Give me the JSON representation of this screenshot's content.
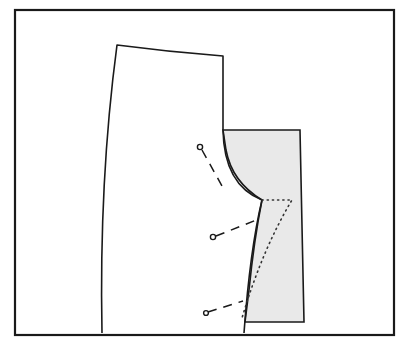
{
  "figure": {
    "colors": {
      "line": "#1a1a1a",
      "patch_fill": "#e9e9e9",
      "background": "#ffffff"
    },
    "elements": {
      "frame": "outer-border",
      "pattern_piece": "trouser-front-pattern",
      "patch": "shaded-crotch-extension",
      "new_seam": "dotted-stitching-line",
      "pins": [
        "pin-top",
        "pin-middle",
        "pin-bottom"
      ]
    }
  }
}
